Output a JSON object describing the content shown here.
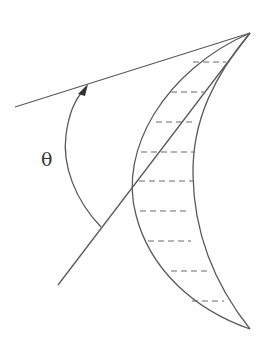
{
  "diagram": {
    "type": "geometric-figure",
    "labels": {
      "angle": "θ"
    },
    "colors": {
      "line": "#5a5a5a",
      "dash": "#6a6a6a",
      "background": "#ffffff"
    },
    "elements": [
      {
        "name": "upper-line",
        "from": [
          15,
          107
        ],
        "to": [
          250,
          33
        ]
      },
      {
        "name": "diagonal-line",
        "from": [
          58,
          285
        ],
        "to": [
          250,
          33
        ]
      },
      {
        "name": "angle-arc-arrow",
        "from": [
          101,
          227
        ],
        "to": [
          85,
          86
        ]
      },
      {
        "name": "crescent-outer-curve",
        "from": [
          250,
          33
        ],
        "via": [
          133,
          174
        ],
        "to": [
          250,
          329
        ]
      },
      {
        "name": "crescent-inner-curve",
        "from": [
          250,
          33
        ],
        "via": [
          194,
          174
        ],
        "to": [
          250,
          329
        ]
      },
      {
        "name": "hatch-lines",
        "count": 9
      }
    ]
  }
}
